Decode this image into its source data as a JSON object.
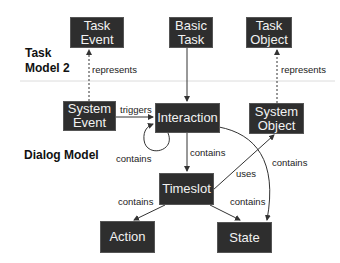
{
  "sections": {
    "task_model": "Task\nModel 2",
    "dialog_model": "Dialog Model"
  },
  "nodes": {
    "task_event": "Task\nEvent",
    "basic_task": "Basic\nTask",
    "task_object": "Task\nObject",
    "system_event": "System\nEvent",
    "interaction": "Interaction",
    "system_object": "System\nObject",
    "timeslot": "Timeslot",
    "action": "Action",
    "state": "State"
  },
  "edges": {
    "system_event_represents_task_event": "represents",
    "system_object_represents_task_object": "represents",
    "system_event_triggers_interaction": "triggers",
    "interaction_contains_self": "contains",
    "interaction_contains_timeslot": "contains",
    "interaction_contains_state": "contains",
    "timeslot_uses_system_object": "uses",
    "timeslot_contains_action": "contains",
    "timeslot_contains_state": "contains"
  },
  "colors": {
    "node_fill": "#2e2e2e",
    "node_text": "#f2f2f2",
    "edge": "#333333",
    "separator": "#d8d8d8"
  }
}
